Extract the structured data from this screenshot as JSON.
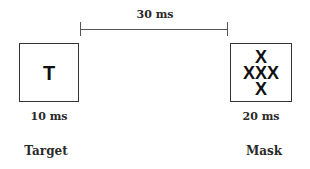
{
  "timeline": {
    "soa_label": "30 ms",
    "line_color": "#555555"
  },
  "stimuli": [
    {
      "name": "Target",
      "duration": "10 ms",
      "content_rows": [
        "T"
      ]
    },
    {
      "name": "Mask",
      "duration": "20 ms",
      "content_rows": [
        "X",
        "XXX",
        "X"
      ]
    }
  ],
  "colors": {
    "background": "#ffffff",
    "box_border": "#333333",
    "text": "#2a2a2a",
    "glyph": "#111111"
  }
}
